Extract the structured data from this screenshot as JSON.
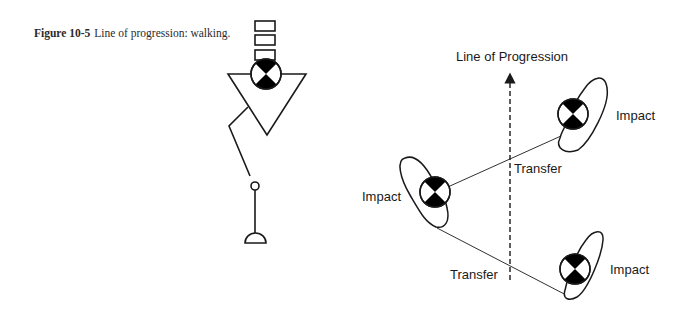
{
  "caption": {
    "figure_label": "Figure 10-5",
    "text": "Line of progression: walking."
  },
  "diagram": {
    "title": "Line of Progression",
    "labels": {
      "impact_top_right": "Impact",
      "impact_left": "Impact",
      "impact_bottom_right": "Impact",
      "transfer_upper": "Transfer",
      "transfer_lower": "Transfer"
    },
    "colors": {
      "stroke": "#1a1a1a",
      "fill": "#000000",
      "background": "#ffffff"
    }
  }
}
